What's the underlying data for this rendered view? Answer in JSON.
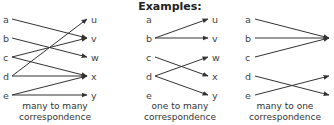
{
  "title": "Examples:",
  "panels": [
    {
      "caption_line1": "many to many",
      "caption_line2": "correspondence",
      "left_labels": [
        "a",
        "b",
        "c",
        "d",
        "e"
      ],
      "right_labels": [
        "u",
        "v",
        "w",
        "x",
        "y"
      ],
      "edges": [
        [
          "a",
          "v"
        ],
        [
          "b",
          "w"
        ],
        [
          "c",
          "v"
        ],
        [
          "c",
          "x"
        ],
        [
          "d",
          "u"
        ],
        [
          "d",
          "x"
        ],
        [
          "e",
          "x"
        ],
        [
          "e",
          "y"
        ]
      ]
    },
    {
      "caption_line1": "one to many",
      "caption_line2": "correspondence",
      "left_labels": [
        "a",
        "b",
        "c",
        "d",
        "e"
      ],
      "right_labels": [
        "u",
        "v",
        "w",
        "x",
        "y"
      ],
      "edges": [
        [
          "b",
          "u"
        ],
        [
          "b",
          "v"
        ],
        [
          "c",
          "x"
        ],
        [
          "d",
          "w"
        ],
        [
          "d",
          "y"
        ]
      ]
    },
    {
      "caption_line1": "many to one",
      "caption_line2": "correspondence",
      "left_labels": [
        "a",
        "b",
        "c",
        "d",
        "e"
      ],
      "right_labels": [],
      "edges": [
        [
          "a",
          "v"
        ],
        [
          "b",
          "v"
        ],
        [
          "c",
          "v"
        ],
        [
          "d",
          "y"
        ],
        [
          "e",
          "x"
        ]
      ]
    }
  ],
  "colors": {
    "line": "#333333",
    "text": "#444444"
  }
}
